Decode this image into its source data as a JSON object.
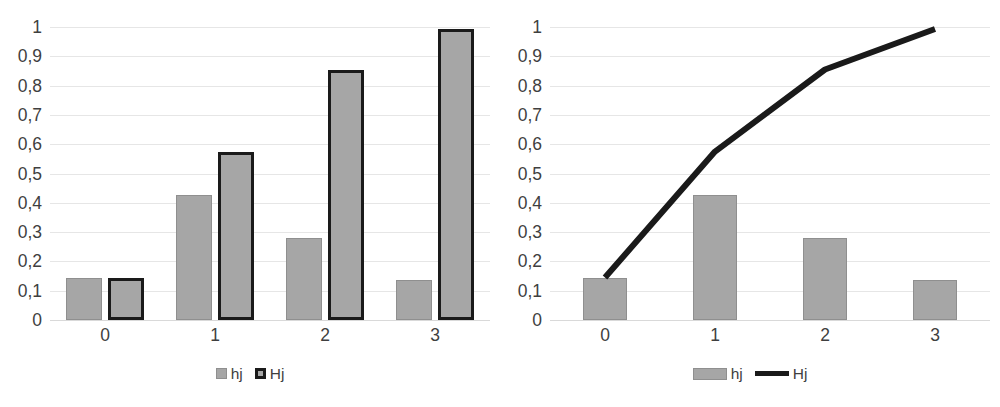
{
  "chart_data": [
    {
      "type": "bar",
      "title": "",
      "xlabel": "",
      "ylabel": "",
      "categories": [
        "0",
        "1",
        "2",
        "3"
      ],
      "series": [
        {
          "name": "hj",
          "values": [
            0.143,
            0.425,
            0.281,
            0.138
          ]
        },
        {
          "name": "Hj",
          "values": [
            0.145,
            0.575,
            0.855,
            0.993
          ]
        }
      ],
      "ylim": [
        0,
        1
      ],
      "ytick_labels": [
        "1",
        "0,9",
        "0,8",
        "0,7",
        "0,6",
        "0,5",
        "0,4",
        "0,3",
        "0,2",
        "0,1",
        "0"
      ],
      "ytick_values": [
        1,
        0.9,
        0.8,
        0.7,
        0.6,
        0.5,
        0.4,
        0.3,
        0.2,
        0.1,
        0
      ],
      "grid": true,
      "legend_position": "bottom",
      "legend": [
        {
          "label": "hj",
          "marker": "square-thin-border",
          "color": "#a6a6a6"
        },
        {
          "label": "Hj",
          "marker": "square-thick-border",
          "color": "#a6a6a6"
        }
      ]
    },
    {
      "type": "bar",
      "title": "",
      "xlabel": "",
      "ylabel": "",
      "categories": [
        "0",
        "1",
        "2",
        "3"
      ],
      "series": [
        {
          "name": "hj",
          "type": "bar",
          "values": [
            0.143,
            0.425,
            0.281,
            0.138
          ]
        },
        {
          "name": "Hj",
          "type": "line",
          "values": [
            0.145,
            0.575,
            0.855,
            0.993
          ]
        }
      ],
      "ylim": [
        0,
        1
      ],
      "ytick_labels": [
        "1",
        "0,9",
        "0,8",
        "0,7",
        "0,6",
        "0,5",
        "0,4",
        "0,3",
        "0,2",
        "0,1",
        "0"
      ],
      "ytick_values": [
        1,
        0.9,
        0.8,
        0.7,
        0.6,
        0.5,
        0.4,
        0.3,
        0.2,
        0.1,
        0
      ],
      "grid": true,
      "legend_position": "bottom",
      "legend": [
        {
          "label": "hj",
          "marker": "wide-rect",
          "color": "#a6a6a6"
        },
        {
          "label": "Hj",
          "marker": "thick-line",
          "color": "#1a1a1a"
        }
      ]
    }
  ],
  "colors": {
    "bar_fill": "#a6a6a6",
    "bar_border_thin": "#8f8f8f",
    "bar_border_thick": "#1a1a1a",
    "line": "#1a1a1a",
    "gridline": "#e6e6e6",
    "axis": "#d9d9d9",
    "text": "#3f3f3f",
    "background": "#ffffff"
  }
}
